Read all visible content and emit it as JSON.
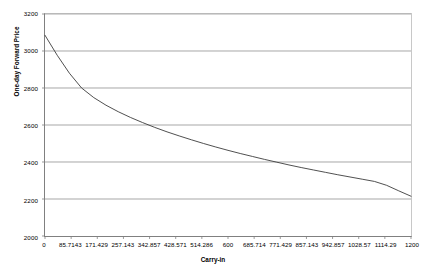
{
  "chart_data": {
    "type": "line",
    "title": "",
    "xlabel": "Carry-in",
    "ylabel": "One-day Forward Price",
    "xlim": [
      0,
      1200
    ],
    "ylim": [
      2000,
      3200
    ],
    "grid": true,
    "legend": "none",
    "line_color": "#3a3a3a",
    "grid_color": "#a6a6a6",
    "axis_color": "#808080",
    "background": "#ffffff",
    "y_ticks": [
      3200,
      3000,
      2800,
      2600,
      2400,
      2200,
      2000
    ],
    "y_tick_labels": [
      "3200",
      "3000",
      "2800",
      "2600",
      "2400",
      "2200",
      "2000"
    ],
    "x_ticks": [
      0,
      85.7143,
      171.429,
      257.143,
      342.857,
      428.571,
      514.286,
      600,
      685.714,
      771.429,
      857.143,
      942.857,
      1028.57,
      1114.29,
      1200
    ],
    "x_tick_labels": [
      "0",
      "85.7143",
      "171.429",
      "257.143",
      "342.857",
      "428.571",
      "514.286",
      "600",
      "685.714",
      "771.429",
      "857.143",
      "942.857",
      "1028.57",
      "1114.29",
      "1200"
    ],
    "x": [
      0,
      40,
      80,
      120,
      160,
      200,
      240,
      280,
      320,
      360,
      400,
      440,
      480,
      520,
      560,
      600,
      640,
      680,
      720,
      760,
      800,
      840,
      880,
      920,
      960,
      1000,
      1040,
      1080,
      1120,
      1160,
      1200
    ],
    "y": [
      3085,
      2977,
      2880,
      2800,
      2748,
      2707,
      2672,
      2641,
      2613,
      2587,
      2563,
      2541,
      2520,
      2500,
      2481,
      2463,
      2446,
      2430,
      2414,
      2399,
      2384,
      2370,
      2357,
      2344,
      2331,
      2319,
      2307,
      2295,
      2274,
      2244,
      2215
    ],
    "series": [
      {
        "name": "One-day Forward Price",
        "values": [
          3085,
          2977,
          2880,
          2800,
          2748,
          2707,
          2672,
          2641,
          2613,
          2587,
          2563,
          2541,
          2520,
          2500,
          2481,
          2463,
          2446,
          2430,
          2414,
          2399,
          2384,
          2370,
          2357,
          2344,
          2331,
          2319,
          2307,
          2295,
          2274,
          2244,
          2215
        ]
      }
    ]
  }
}
